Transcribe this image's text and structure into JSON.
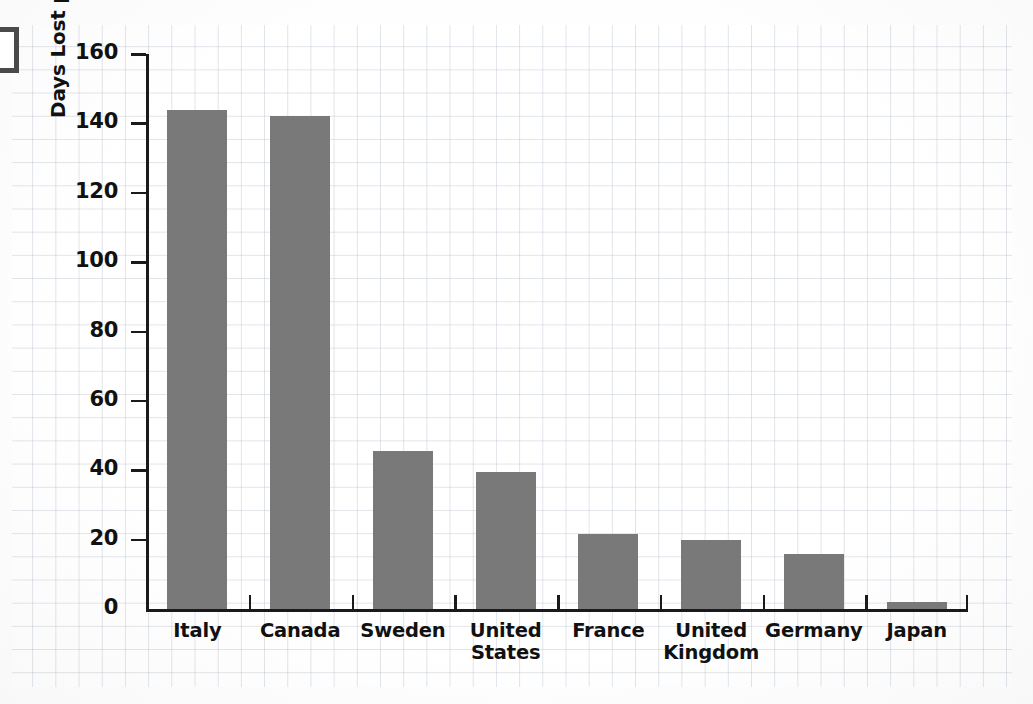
{
  "chart_data": {
    "type": "bar",
    "title": "",
    "xlabel": "",
    "ylabel": "Days Lost per Thousand Workers per Year",
    "ylim": [
      0,
      160
    ],
    "ytick_step": 20,
    "yticks": [
      "160",
      "140",
      "120",
      "100",
      "80",
      "60",
      "40",
      "20",
      "0"
    ],
    "grid": true,
    "legend": "none",
    "bar_color": "#797979",
    "axis_color": "#1a1a1a",
    "categories": [
      "Italy",
      "Canada",
      "Sweden",
      "United States",
      "France",
      "United Kingdom",
      "Germany",
      "Japan"
    ],
    "category_lines": [
      [
        "Italy"
      ],
      [
        "Canada"
      ],
      [
        "Sweden"
      ],
      [
        "United",
        "States"
      ],
      [
        "France"
      ],
      [
        "United",
        "Kingdom"
      ],
      [
        "Germany"
      ],
      [
        "Japan"
      ]
    ],
    "values": [
      144,
      142,
      45.5,
      39.5,
      21.5,
      20,
      16,
      2
    ]
  },
  "page": {
    "background_color": "#fefefe",
    "grid_color": "#b2bcc8",
    "scan_artifact": "bracket-top-left"
  }
}
